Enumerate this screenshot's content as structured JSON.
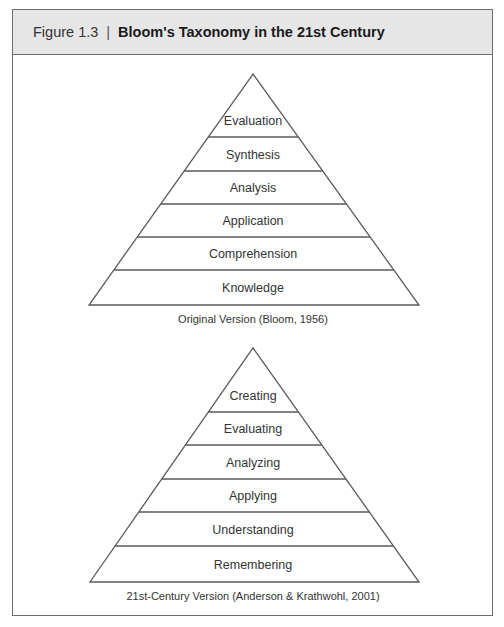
{
  "header": {
    "figure_number": "Figure 1.3",
    "separator": "|",
    "title": "Bloom's Taxonomy in the 21st Century"
  },
  "pyramids": [
    {
      "name": "original",
      "caption": "Original Version (Bloom, 1956)",
      "apex": [
        253,
        74
      ],
      "base_y": 305,
      "base_x": [
        89,
        419
      ],
      "divider_ys": [
        137,
        171,
        204,
        237,
        270
      ],
      "levels_top_to_bottom": [
        "Evaluation",
        "Synthesis",
        "Analysis",
        "Application",
        "Comprehension",
        "Knowledge"
      ],
      "caption_y": 323
    },
    {
      "name": "revised",
      "caption": "21st-Century Version (Anderson & Krathwohl, 2001)",
      "apex": [
        253,
        348
      ],
      "base_y": 582,
      "base_x": [
        90,
        419
      ],
      "divider_ys": [
        412,
        445,
        479,
        512,
        546
      ],
      "levels_top_to_bottom": [
        "Creating",
        "Evaluating",
        "Analyzing",
        "Applying",
        "Understanding",
        "Remembering"
      ],
      "caption_y": 600
    }
  ],
  "colors": {
    "line": "#5a5a5a",
    "header_bg": "#e6e6e6",
    "text": "#333333"
  }
}
